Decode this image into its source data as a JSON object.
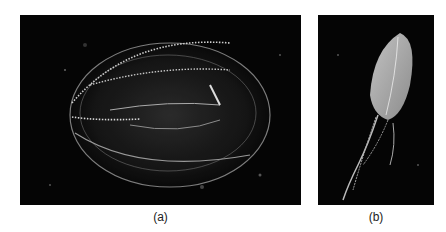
{
  "figure": {
    "panels": [
      {
        "id": "a",
        "label": "(a)",
        "subject": "ctenophore-comb-jelly-oval",
        "background": "#050505"
      },
      {
        "id": "b",
        "label": "(b)",
        "subject": "ctenophore-with-tentacles",
        "background": "#050505"
      }
    ]
  }
}
